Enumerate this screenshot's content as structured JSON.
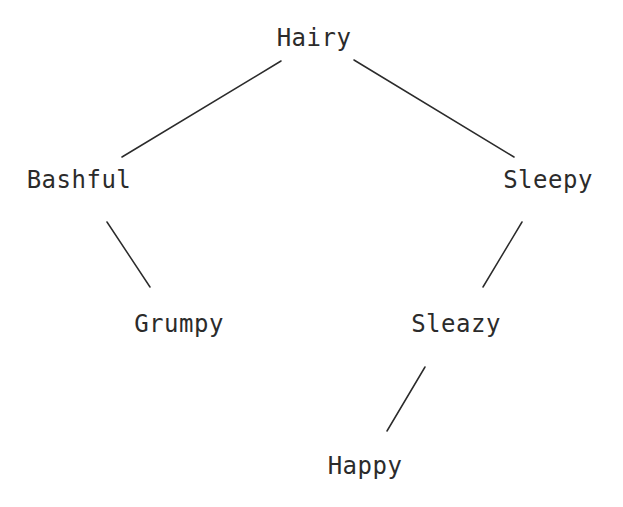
{
  "diagram": {
    "type": "tree",
    "title": "",
    "background_color": "#ffffff",
    "stroke_color": "#2b2b2b",
    "text_color": "#2b2b2b",
    "stroke_width": 1.5,
    "font_size": 24,
    "width": 623,
    "height": 507,
    "nodes": [
      {
        "id": "hairy",
        "label": "Hairy",
        "x": 314,
        "y": 38,
        "level": 0
      },
      {
        "id": "bashful",
        "label": "Bashful",
        "x": 79,
        "y": 180,
        "level": 1
      },
      {
        "id": "sleepy",
        "label": "Sleepy",
        "x": 548,
        "y": 180,
        "level": 1
      },
      {
        "id": "grumpy",
        "label": "Grumpy",
        "x": 179,
        "y": 324,
        "level": 2
      },
      {
        "id": "sleazy",
        "label": "Sleazy",
        "x": 456,
        "y": 324,
        "level": 2
      },
      {
        "id": "happy",
        "label": "Happy",
        "x": 365,
        "y": 466,
        "level": 3
      }
    ],
    "edges": [
      {
        "id": "hairy-bashful",
        "from": "hairy",
        "to": "bashful",
        "x1": 281,
        "y1": 61,
        "x2": 122,
        "y2": 157
      },
      {
        "id": "hairy-sleepy",
        "from": "hairy",
        "to": "sleepy",
        "x1": 354,
        "y1": 60,
        "x2": 514,
        "y2": 157
      },
      {
        "id": "bashful-grumpy",
        "from": "bashful",
        "to": "grumpy",
        "x1": 107,
        "y1": 222,
        "x2": 150,
        "y2": 287
      },
      {
        "id": "sleepy-sleazy",
        "from": "sleepy",
        "to": "sleazy",
        "x1": 522,
        "y1": 222,
        "x2": 483,
        "y2": 287
      },
      {
        "id": "sleazy-happy",
        "from": "sleazy",
        "to": "happy",
        "x1": 425,
        "y1": 367,
        "x2": 387,
        "y2": 431
      }
    ]
  }
}
